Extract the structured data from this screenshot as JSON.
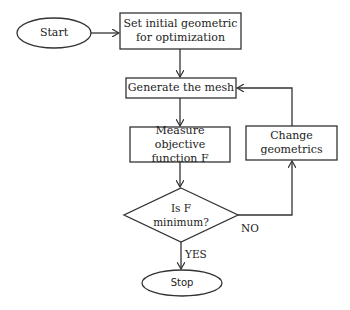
{
  "diagram": {
    "type": "flowchart",
    "nodes": {
      "start": {
        "label": "Start",
        "shape": "ellipse"
      },
      "init": {
        "label": "Set initial geometric for optimization",
        "shape": "rect"
      },
      "mesh": {
        "label": "Generate the mesh",
        "shape": "rect"
      },
      "measure": {
        "label": "Measure objective function F",
        "shape": "rect"
      },
      "decision": {
        "label": "Is F minimum?",
        "shape": "diamond"
      },
      "change": {
        "label": "Change geometrics",
        "shape": "rect"
      },
      "stop": {
        "label": "Stop",
        "shape": "ellipse"
      }
    },
    "edges": [
      {
        "from": "start",
        "to": "init",
        "label": ""
      },
      {
        "from": "init",
        "to": "mesh",
        "label": ""
      },
      {
        "from": "mesh",
        "to": "measure",
        "label": ""
      },
      {
        "from": "measure",
        "to": "decision",
        "label": ""
      },
      {
        "from": "decision",
        "to": "stop",
        "label": "YES"
      },
      {
        "from": "decision",
        "to": "change",
        "label": "NO"
      },
      {
        "from": "change",
        "to": "mesh",
        "label": ""
      }
    ],
    "edge_labels": {
      "yes": "YES",
      "no": "NO"
    },
    "colors": {
      "stroke": "#333333",
      "background": "#ffffff",
      "text": "#222222"
    }
  }
}
